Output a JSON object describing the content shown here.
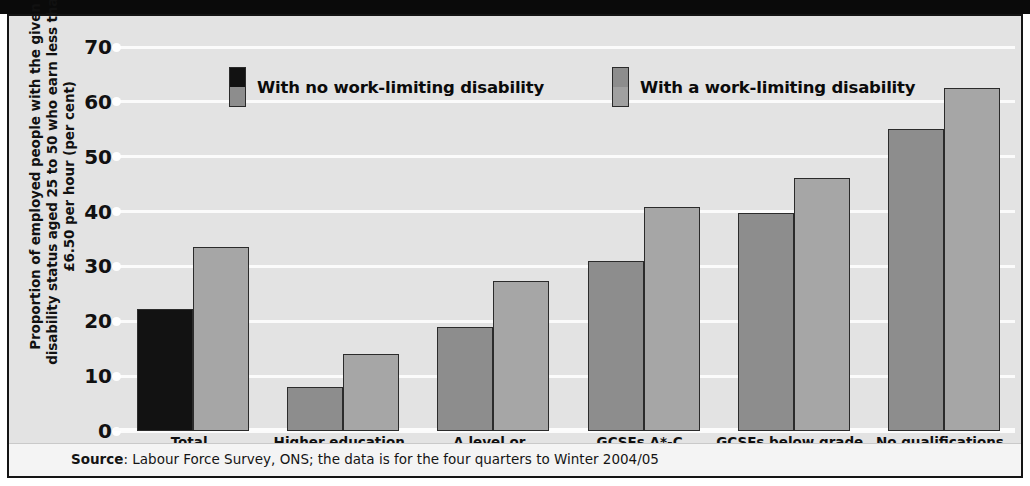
{
  "chart_data": {
    "type": "bar",
    "title": "",
    "xlabel": "",
    "ylabel": "Proportion of employed people with the given disability status aged 25 to 50 who earn less than £6.50 per hour (per cent)",
    "ylim": [
      0,
      70
    ],
    "yticks": [
      0,
      10,
      20,
      30,
      40,
      50,
      60,
      70
    ],
    "ytick_labels": [
      "0",
      "10",
      "20",
      "30",
      "40",
      "50",
      "60",
      "70"
    ],
    "grid": true,
    "legend_position": "top-center",
    "categories": [
      "Total",
      "Higher education",
      "A level or equivalent",
      "GCSEs A*-C",
      "GCSEs below grade C",
      "No qualifications"
    ],
    "series": [
      {
        "name": "With no work-limiting disability",
        "color": "#8d8d8d",
        "highlight_color": "#121212",
        "values": [
          22.2,
          8.0,
          19.0,
          31.0,
          39.8,
          55.0
        ]
      },
      {
        "name": "With a work-limiting disability",
        "color": "#a6a6a6",
        "values": [
          33.5,
          14.0,
          27.4,
          40.8,
          46.2,
          62.5
        ]
      }
    ],
    "source_prefix": "Source",
    "source_text": ": Labour Force Survey, ONS; the data is for the four quarters to Winter 2004/05"
  },
  "colors": {
    "plot_background": "#e3e3e3",
    "gridline": "#fbfbfb",
    "frame": "#141414",
    "series_1": "#8d8d8d",
    "series_1_highlight": "#121212",
    "series_2": "#a6a6a6",
    "footer_background": "#f4f4f4"
  }
}
